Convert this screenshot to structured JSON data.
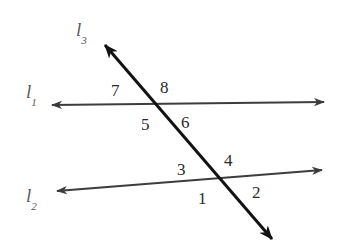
{
  "figure": {
    "background_color": "#ffffff",
    "width": 342,
    "height": 250
  },
  "lines": [
    {
      "id": "l1",
      "label": "l",
      "subscript": "1",
      "label_x": 26,
      "label_y": 82,
      "color": "#3d3d3d",
      "stroke_width": 2,
      "x1": 52,
      "y1": 105,
      "x2": 324,
      "y2": 102,
      "arrow_start": true,
      "arrow_end": true
    },
    {
      "id": "l2",
      "label": "l",
      "subscript": "2",
      "label_x": 26,
      "label_y": 186,
      "color": "#3d3d3d",
      "stroke_width": 2,
      "x1": 57,
      "y1": 191,
      "x2": 322,
      "y2": 170,
      "arrow_start": true,
      "arrow_end": true
    },
    {
      "id": "l3",
      "label": "l",
      "subscript": "3",
      "label_x": 76,
      "label_y": 20,
      "color": "#121212",
      "stroke_width": 3,
      "x1": 105,
      "y1": 45,
      "x2": 272,
      "y2": 239,
      "arrow_start": true,
      "arrow_end": true
    }
  ],
  "intersections": [
    {
      "id": "l3-l1",
      "x": 155,
      "y": 104
    },
    {
      "id": "l3-l2",
      "x": 218,
      "y": 183
    }
  ],
  "angle_labels": [
    {
      "id": "angle-7",
      "text": "7",
      "x": 111,
      "y": 82
    },
    {
      "id": "angle-8",
      "text": "8",
      "x": 160,
      "y": 79
    },
    {
      "id": "angle-5",
      "text": "5",
      "x": 141,
      "y": 116
    },
    {
      "id": "angle-6",
      "text": "6",
      "x": 181,
      "y": 114
    },
    {
      "id": "angle-3",
      "text": "3",
      "x": 177,
      "y": 161
    },
    {
      "id": "angle-4",
      "text": "4",
      "x": 224,
      "y": 152
    },
    {
      "id": "angle-1",
      "text": "1",
      "x": 198,
      "y": 190
    },
    {
      "id": "angle-2",
      "text": "2",
      "x": 252,
      "y": 184
    }
  ]
}
